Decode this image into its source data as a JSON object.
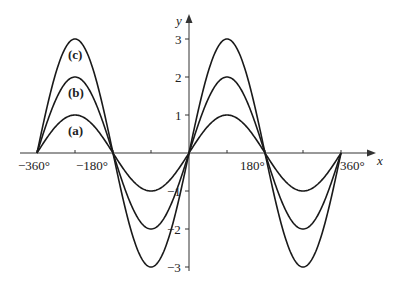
{
  "chart_data": {
    "type": "line",
    "title": "",
    "xlabel": "x",
    "ylabel": "y",
    "xlim": [
      -360,
      360
    ],
    "ylim": [
      -3,
      3
    ],
    "grid": false,
    "x_ticks": [
      -360,
      -270,
      -180,
      -90,
      0,
      90,
      180,
      270,
      360
    ],
    "x_tick_labels": [
      "−360°",
      "−180°",
      "180°",
      "360°"
    ],
    "y_ticks": [
      -3,
      -2,
      -1,
      1,
      2,
      3
    ],
    "y_tick_labels": [
      "−3",
      "−2",
      "−1",
      "1",
      "2",
      "3"
    ],
    "series": [
      {
        "name": "(a)",
        "function": "y = sin x",
        "amplitude": 1,
        "x": [
          -360,
          -270,
          -180,
          -90,
          0,
          90,
          180,
          270,
          360
        ],
        "values": [
          0,
          1,
          0,
          -1,
          0,
          1,
          0,
          -1,
          0
        ]
      },
      {
        "name": "(b)",
        "function": "y = 2 sin x",
        "amplitude": 2,
        "x": [
          -360,
          -270,
          -180,
          -90,
          0,
          90,
          180,
          270,
          360
        ],
        "values": [
          0,
          2,
          0,
          -2,
          0,
          2,
          0,
          -2,
          0
        ]
      },
      {
        "name": "(c)",
        "function": "y = 3 sin x",
        "amplitude": 3,
        "x": [
          -360,
          -270,
          -180,
          -90,
          0,
          90,
          180,
          270,
          360
        ],
        "values": [
          0,
          3,
          0,
          -3,
          0,
          3,
          0,
          -3,
          0
        ]
      }
    ],
    "annotations": [
      "(a)",
      "(b)",
      "(c)"
    ]
  },
  "labels": {
    "x_axis": "x",
    "y_axis": "y",
    "xt_m360": "−360°",
    "xt_m180": "−180°",
    "xt_180": "180°",
    "xt_360": "360°",
    "yt_3": "3",
    "yt_2": "2",
    "yt_1": "1",
    "yt_m1": "−1",
    "yt_m2": "−2",
    "yt_m3": "−3",
    "curve_a": "(a)",
    "curve_b": "(b)",
    "curve_c": "(c)"
  }
}
